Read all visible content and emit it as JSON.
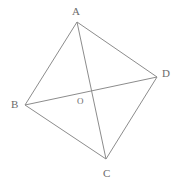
{
  "figure": {
    "type": "geometry-diagram",
    "canvas": {
      "width": 177,
      "height": 187,
      "background": "#ffffff"
    },
    "stroke_color": "#8c8c8c",
    "label_color": "#6b6b6b",
    "points": [
      {
        "id": "A",
        "label": "A",
        "x": 77,
        "y": 22,
        "label_x": 72,
        "label_y": 6
      },
      {
        "id": "B",
        "label": "B",
        "x": 25,
        "y": 105,
        "label_x": 11,
        "label_y": 99
      },
      {
        "id": "C",
        "label": "C",
        "x": 106,
        "y": 159,
        "label_x": 103,
        "label_y": 168
      },
      {
        "id": "D",
        "label": "D",
        "x": 157,
        "y": 77,
        "label_x": 162,
        "label_y": 68
      },
      {
        "id": "O",
        "label": "O",
        "x": 91,
        "y": 89,
        "label_x": 77,
        "label_y": 97
      }
    ],
    "edges": [
      {
        "id": "AB",
        "from": "A",
        "to": "B",
        "x1": 77,
        "y1": 22,
        "x2": 25,
        "y2": 105
      },
      {
        "id": "BC",
        "from": "B",
        "to": "C",
        "x1": 25,
        "y1": 105,
        "x2": 106,
        "y2": 159
      },
      {
        "id": "CD",
        "from": "C",
        "to": "D",
        "x1": 106,
        "y1": 159,
        "x2": 157,
        "y2": 77
      },
      {
        "id": "DA",
        "from": "D",
        "to": "A",
        "x1": 157,
        "y1": 77,
        "x2": 77,
        "y2": 22
      }
    ],
    "diagonals": [
      {
        "id": "AC",
        "from": "A",
        "to": "C",
        "x1": 77,
        "y1": 22,
        "x2": 106,
        "y2": 159
      },
      {
        "id": "BD",
        "from": "B",
        "to": "D",
        "x1": 25,
        "y1": 105,
        "x2": 157,
        "y2": 77
      }
    ]
  }
}
